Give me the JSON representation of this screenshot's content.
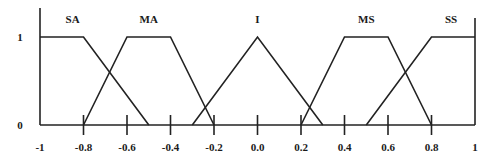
{
  "chart_data": {
    "type": "line",
    "title": "",
    "xlabel": "",
    "ylabel": "",
    "xlim": [
      -1,
      1
    ],
    "ylim": [
      0,
      1
    ],
    "grid": false,
    "x_ticks": [
      -1,
      -0.8,
      -0.6,
      -0.4,
      -0.2,
      0.0,
      0.2,
      0.4,
      0.6,
      0.8,
      1
    ],
    "x_tick_labels": [
      "-1",
      "-0.8",
      "-0.6",
      "-0.4",
      "-0.2",
      "0.0",
      "0.2",
      "0.4",
      "0.6",
      "0.8",
      "1"
    ],
    "y_ticks": [
      0,
      1
    ],
    "y_tick_labels": [
      "0",
      "1"
    ],
    "series": [
      {
        "name": "SA",
        "shape": "trapezoid",
        "x": [
          -1,
          -0.8,
          -0.5
        ],
        "y": [
          1,
          1,
          0
        ],
        "label_x": -0.85
      },
      {
        "name": "MA",
        "shape": "trapezoid",
        "x": [
          -0.8,
          -0.6,
          -0.4,
          -0.2
        ],
        "y": [
          0,
          1,
          1,
          0
        ],
        "label_x": -0.5
      },
      {
        "name": "I",
        "shape": "triangle",
        "x": [
          -0.3,
          0.0,
          0.3
        ],
        "y": [
          0,
          1,
          0
        ],
        "label_x": 0.0
      },
      {
        "name": "MS",
        "shape": "trapezoid",
        "x": [
          0.2,
          0.4,
          0.6,
          0.8
        ],
        "y": [
          0,
          1,
          1,
          0
        ],
        "label_x": 0.5
      },
      {
        "name": "SS",
        "shape": "trapezoid",
        "x": [
          0.5,
          0.8,
          1
        ],
        "y": [
          0,
          1,
          1
        ],
        "label_x": 0.89
      }
    ]
  }
}
